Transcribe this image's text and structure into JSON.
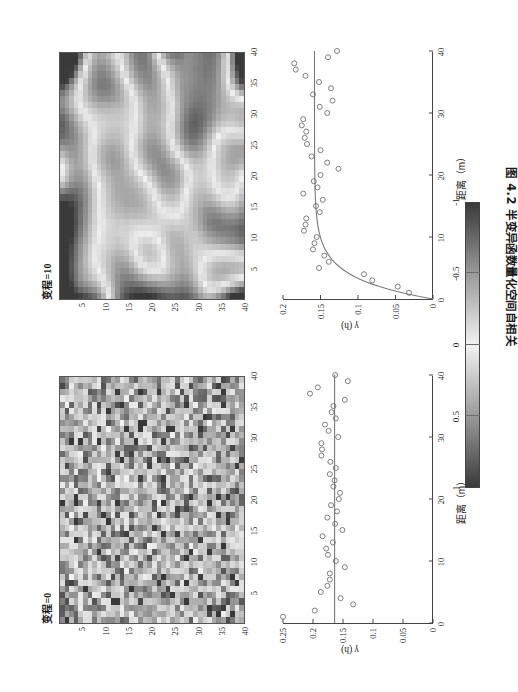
{
  "caption": "图 4.2  半变异函数量化空间自相关",
  "colorbar": {
    "ticks": [
      1,
      0.5,
      0,
      -0.5,
      -1
    ],
    "tick_labels": [
      "1",
      "0.5",
      "0",
      "-0.5",
      "-1"
    ],
    "low_color": "#3a3a3a",
    "mid_color": "#f2f2f2",
    "high_color": "#3a3a3a"
  },
  "panels": [
    {
      "id": "range-0",
      "title": "变程=0",
      "heatmap_tick_labels": [
        "5",
        "10",
        "15",
        "20",
        "25",
        "30",
        "35",
        "40"
      ],
      "heatmap_ticks": [
        5,
        10,
        15,
        20,
        25,
        30,
        35,
        40
      ],
      "scatter_xlabel": "距离（m）",
      "scatter_ylabel": "γ (h)",
      "scatter_x_tick_labels": [
        "0",
        "10",
        "20",
        "30",
        "40"
      ],
      "scatter_y_tick_labels": [
        "0",
        "0.05",
        "0.1",
        "0.15",
        "0.2",
        "0.25"
      ]
    },
    {
      "id": "range-10",
      "title": "变程=10",
      "heatmap_tick_labels": [
        "5",
        "10",
        "15",
        "20",
        "25",
        "30",
        "35",
        "40"
      ],
      "heatmap_ticks": [
        5,
        10,
        15,
        20,
        25,
        30,
        35,
        40
      ],
      "scatter_xlabel": "距离（m）",
      "scatter_ylabel": "γ (h)",
      "scatter_x_tick_labels": [
        "0",
        "10",
        "20",
        "30",
        "40"
      ],
      "scatter_y_tick_labels": [
        "0",
        "0.05",
        "0.1",
        "0.15",
        "0.2"
      ]
    }
  ],
  "chart_data": [
    {
      "type": "heatmap",
      "title": "变程=0",
      "xlim": [
        0,
        40
      ],
      "ylim": [
        0,
        40
      ],
      "grid_size": 40,
      "value_range": [
        -1,
        1
      ],
      "colormap": "gray-diverging",
      "description": "Spatially uncorrelated (nugget) random field, 40x40 cells",
      "xlabel": "",
      "ylabel": "",
      "xticks": [
        5,
        10,
        15,
        20,
        25,
        30,
        35,
        40
      ],
      "yticks": [
        5,
        10,
        15,
        20,
        25,
        30,
        35,
        40
      ],
      "seed": 1,
      "correlation_range": 0
    },
    {
      "type": "heatmap",
      "title": "变程=10",
      "xlim": [
        0,
        40
      ],
      "ylim": [
        0,
        40
      ],
      "grid_size": 40,
      "value_range": [
        -1,
        1
      ],
      "colormap": "gray-diverging",
      "description": "Spatially autocorrelated random field with range = 10, 40x40 cells",
      "xlabel": "",
      "ylabel": "",
      "xticks": [
        5,
        10,
        15,
        20,
        25,
        30,
        35,
        40
      ],
      "yticks": [
        5,
        10,
        15,
        20,
        25,
        30,
        35,
        40
      ],
      "seed": 2,
      "correlation_range": 10
    },
    {
      "type": "scatter",
      "title": "变程=0 semivariogram",
      "xlabel": "距离（m）",
      "ylabel": "γ (h)",
      "xlim": [
        0,
        40
      ],
      "ylim": [
        0,
        0.25
      ],
      "xticks": [
        0,
        10,
        20,
        30,
        40
      ],
      "yticks": [
        0,
        0.05,
        0.1,
        0.15,
        0.2,
        0.25
      ],
      "grid": false,
      "legend": "none",
      "series": [
        {
          "name": "实验半变异值",
          "marker": "open-circle",
          "x": [
            1.0,
            2.0,
            3.0,
            4.0,
            5.0,
            6.0,
            7.0,
            8.0,
            9.0,
            10.0,
            11.0,
            12.0,
            13.0,
            14.0,
            15.0,
            16.0,
            17.0,
            18.0,
            19.0,
            20.0,
            21.0,
            22.0,
            23.0,
            24.0,
            25.0,
            26.0,
            27.0,
            28.0,
            29.0,
            30.0,
            31.0,
            32.0,
            33.0,
            34.0,
            35.0,
            36.0,
            37.0,
            38.0,
            39.0,
            40.0
          ],
          "y": [
            0.25,
            0.197,
            0.133,
            0.154,
            0.187,
            0.176,
            0.172,
            0.172,
            0.147,
            0.162,
            0.175,
            0.178,
            0.167,
            0.184,
            0.151,
            0.163,
            0.176,
            0.16,
            0.17,
            0.157,
            0.155,
            0.166,
            0.164,
            0.172,
            0.162,
            0.171,
            0.186,
            0.185,
            0.186,
            0.158,
            0.174,
            0.18,
            0.162,
            0.169,
            0.166,
            0.147,
            0.205,
            0.192,
            0.142,
            0.163
          ]
        },
        {
          "name": "拟合模型（块金效应）",
          "marker": "line",
          "model": "pure-nugget",
          "x": [
            0,
            40
          ],
          "y": [
            0.164,
            0.164
          ]
        }
      ]
    },
    {
      "type": "scatter",
      "title": "变程=10 semivariogram",
      "xlabel": "距离（m）",
      "ylabel": "γ (h)",
      "xlim": [
        0,
        40
      ],
      "ylim": [
        0,
        0.2
      ],
      "xticks": [
        0,
        10,
        20,
        30,
        40
      ],
      "yticks": [
        0,
        0.05,
        0.1,
        0.15,
        0.2
      ],
      "grid": false,
      "legend": "none",
      "series": [
        {
          "name": "实验半变异值",
          "marker": "open-circle",
          "x": [
            1.0,
            2.0,
            3.0,
            4.0,
            5.0,
            6.0,
            7.0,
            8.0,
            9.0,
            10.0,
            11.0,
            12.0,
            13.0,
            14.0,
            15.0,
            16.0,
            17.0,
            18.0,
            19.0,
            20.0,
            21.0,
            22.0,
            23.0,
            24.0,
            25.0,
            26.0,
            27.0,
            28.0,
            29.0,
            30.0,
            31.0,
            32.0,
            33.0,
            34.0,
            35.0,
            36.0,
            37.0,
            38.0,
            39.0,
            40.0
          ],
          "y": [
            0.032,
            0.047,
            0.081,
            0.092,
            0.152,
            0.139,
            0.145,
            0.16,
            0.158,
            0.155,
            0.172,
            0.17,
            0.169,
            0.151,
            0.156,
            0.147,
            0.173,
            0.154,
            0.159,
            0.15,
            0.126,
            0.141,
            0.162,
            0.15,
            0.168,
            0.171,
            0.169,
            0.175,
            0.173,
            0.141,
            0.151,
            0.134,
            0.16,
            0.136,
            0.152,
            0.17,
            0.183,
            0.185,
            0.14,
            0.128
          ]
        },
        {
          "name": "拟合模型（指数模型）",
          "marker": "line",
          "model": "exponential",
          "nugget": 0.0,
          "sill": 0.158,
          "range": 10,
          "x": [
            0,
            2,
            4,
            6,
            8,
            10,
            14,
            18,
            22,
            26,
            30,
            34,
            38,
            40
          ],
          "y": [
            0.0,
            0.055,
            0.098,
            0.124,
            0.14,
            0.148,
            0.155,
            0.157,
            0.158,
            0.158,
            0.158,
            0.158,
            0.158,
            0.158
          ]
        }
      ]
    }
  ]
}
